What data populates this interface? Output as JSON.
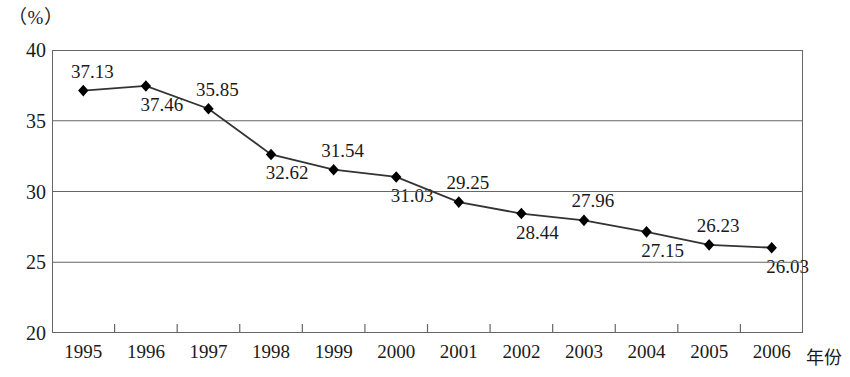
{
  "axes": {
    "unit_label": "（%）",
    "x_axis_name": "年份",
    "y_ticks": [
      "40",
      "35",
      "30",
      "25",
      "20"
    ],
    "x_ticks": [
      "1995",
      "1996",
      "1997",
      "1998",
      "1999",
      "2000",
      "2001",
      "2002",
      "2003",
      "2004",
      "2005",
      "2006"
    ]
  },
  "style": {
    "line_color": "#333333",
    "marker_color": "#000000",
    "frame_color": "#666666",
    "grid_color": "#666666",
    "text_color": "#1a1a1a"
  },
  "chart_data": {
    "type": "line",
    "title": "",
    "subtitle": "",
    "xlabel": "年份",
    "ylabel": "（%）",
    "ylim": [
      20,
      40
    ],
    "ytick_values": [
      20,
      25,
      30,
      35,
      40
    ],
    "grid": true,
    "legend": false,
    "marker": "diamond",
    "categories": [
      "1995",
      "1996",
      "1997",
      "1998",
      "1999",
      "2000",
      "2001",
      "2002",
      "2003",
      "2004",
      "2005",
      "2006"
    ],
    "values": [
      37.13,
      37.46,
      35.85,
      32.62,
      31.54,
      31.03,
      29.25,
      28.44,
      27.96,
      27.15,
      26.23,
      26.03
    ],
    "data_labels": [
      "37.13",
      "37.46",
      "35.85",
      "32.62",
      "31.54",
      "31.03",
      "29.25",
      "28.44",
      "27.96",
      "27.15",
      "26.23",
      "26.03"
    ],
    "data_label_positions": [
      "above",
      "below",
      "above",
      "below",
      "above",
      "below",
      "above",
      "below",
      "above",
      "below",
      "above",
      "below"
    ]
  }
}
